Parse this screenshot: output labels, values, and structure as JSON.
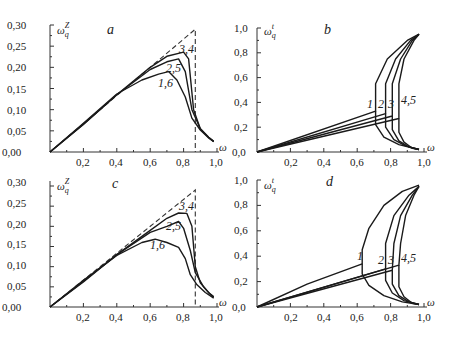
{
  "chart_data": [
    {
      "panel": "a",
      "type": "line",
      "title": "a",
      "xlabel": "ω",
      "ylabel": "ω_q^Z",
      "xlim": [
        0,
        1.0
      ],
      "ylim": [
        0,
        0.3
      ],
      "xticks": [
        "0,2",
        "0,4",
        "0,6",
        "0,8",
        "1,0"
      ],
      "yticks": [
        "0,00",
        "0,05",
        "0,10",
        "0,15",
        "0,20",
        "0,25",
        "0,30"
      ],
      "series": [
        {
          "name": "dashed",
          "style": "dashed",
          "points": [
            [
              0,
              0
            ],
            [
              0.87,
              0.29
            ],
            [
              0.87,
              0.0
            ]
          ]
        },
        {
          "name": "3,4",
          "points": [
            [
              0,
              0
            ],
            [
              0.2,
              0.065
            ],
            [
              0.4,
              0.135
            ],
            [
              0.6,
              0.2
            ],
            [
              0.7,
              0.226
            ],
            [
              0.8,
              0.236
            ],
            [
              0.83,
              0.22
            ],
            [
              0.86,
              0.1
            ],
            [
              0.9,
              0.055
            ],
            [
              0.95,
              0.035
            ],
            [
              0.98,
              0.025
            ]
          ]
        },
        {
          "name": "2,5",
          "points": [
            [
              0,
              0
            ],
            [
              0.2,
              0.066
            ],
            [
              0.4,
              0.135
            ],
            [
              0.6,
              0.195
            ],
            [
              0.7,
              0.213
            ],
            [
              0.77,
              0.22
            ],
            [
              0.81,
              0.19
            ],
            [
              0.85,
              0.1
            ],
            [
              0.9,
              0.055
            ],
            [
              0.95,
              0.034
            ],
            [
              0.98,
              0.025
            ]
          ]
        },
        {
          "name": "1,6",
          "points": [
            [
              0,
              0
            ],
            [
              0.2,
              0.068
            ],
            [
              0.4,
              0.137
            ],
            [
              0.55,
              0.17
            ],
            [
              0.65,
              0.184
            ],
            [
              0.71,
              0.19
            ],
            [
              0.76,
              0.17
            ],
            [
              0.81,
              0.13
            ],
            [
              0.85,
              0.08
            ],
            [
              0.9,
              0.052
            ],
            [
              0.95,
              0.033
            ],
            [
              0.98,
              0.024
            ]
          ]
        }
      ],
      "annotations": [
        "3,4",
        "2,5",
        "1,6"
      ]
    },
    {
      "panel": "b",
      "type": "line",
      "title": "b",
      "xlabel": "ω",
      "ylabel": "ω_q^t",
      "xlim": [
        0,
        1.0
      ],
      "ylim": [
        0,
        1.0
      ],
      "xticks": [
        "0,0",
        "0,2",
        "0,4",
        "0,6",
        "0,8",
        "1,0"
      ],
      "yticks": [
        "0,2",
        "0,4",
        "0,6",
        "0,8",
        "1,0"
      ],
      "series": [
        {
          "name": "1",
          "points": [
            [
              0,
              0
            ],
            [
              0.71,
              0.33
            ],
            [
              0.71,
              0.55
            ],
            [
              0.78,
              0.75
            ],
            [
              0.9,
              0.9
            ],
            [
              0.97,
              0.95
            ]
          ],
          "lower": [
            [
              0.71,
              0.33
            ],
            [
              0.71,
              0.22
            ],
            [
              0.76,
              0.12
            ],
            [
              0.85,
              0.06
            ],
            [
              0.97,
              0.02
            ]
          ]
        },
        {
          "name": "2",
          "points": [
            [
              0,
              0
            ],
            [
              0.77,
              0.31
            ],
            [
              0.77,
              0.55
            ],
            [
              0.83,
              0.75
            ],
            [
              0.92,
              0.9
            ],
            [
              0.97,
              0.95
            ]
          ],
          "lower": [
            [
              0.77,
              0.31
            ],
            [
              0.77,
              0.2
            ],
            [
              0.82,
              0.1
            ],
            [
              0.89,
              0.05
            ],
            [
              0.97,
              0.02
            ]
          ]
        },
        {
          "name": "3",
          "points": [
            [
              0,
              0
            ],
            [
              0.81,
              0.29
            ],
            [
              0.81,
              0.55
            ],
            [
              0.86,
              0.75
            ],
            [
              0.93,
              0.9
            ],
            [
              0.97,
              0.95
            ]
          ],
          "lower": [
            [
              0.81,
              0.29
            ],
            [
              0.81,
              0.18
            ],
            [
              0.85,
              0.09
            ],
            [
              0.91,
              0.04
            ],
            [
              0.97,
              0.02
            ]
          ]
        },
        {
          "name": "4,5",
          "points": [
            [
              0,
              0
            ],
            [
              0.85,
              0.27
            ],
            [
              0.85,
              0.55
            ],
            [
              0.88,
              0.75
            ],
            [
              0.94,
              0.9
            ],
            [
              0.97,
              0.95
            ]
          ],
          "lower": [
            [
              0.85,
              0.27
            ],
            [
              0.85,
              0.16
            ],
            [
              0.88,
              0.08
            ],
            [
              0.93,
              0.03
            ],
            [
              0.97,
              0.02
            ]
          ]
        }
      ],
      "annotations": [
        "1",
        "2",
        "3",
        "4,5"
      ]
    },
    {
      "panel": "c",
      "type": "line",
      "title": "c",
      "xlabel": "ω",
      "ylabel": "ω_q^Z",
      "xlim": [
        0,
        1.0
      ],
      "ylim": [
        0,
        0.3
      ],
      "xticks": [
        "0,2",
        "0,4",
        "0,6",
        "0,8",
        "1,0"
      ],
      "yticks": [
        "0,00",
        "0,05",
        "0,10",
        "0,15",
        "0,20",
        "0,25",
        "0,30"
      ],
      "series": [
        {
          "name": "dashed",
          "style": "dashed",
          "points": [
            [
              0,
              0
            ],
            [
              0.87,
              0.29
            ],
            [
              0.87,
              0.0
            ]
          ]
        },
        {
          "name": "3,4",
          "points": [
            [
              0,
              0
            ],
            [
              0.2,
              0.062
            ],
            [
              0.4,
              0.13
            ],
            [
              0.6,
              0.19
            ],
            [
              0.7,
              0.22
            ],
            [
              0.77,
              0.233
            ],
            [
              0.82,
              0.232
            ],
            [
              0.85,
              0.2
            ],
            [
              0.87,
              0.1
            ],
            [
              0.9,
              0.06
            ],
            [
              0.95,
              0.035
            ],
            [
              0.98,
              0.025
            ]
          ]
        },
        {
          "name": "2,5",
          "points": [
            [
              0,
              0
            ],
            [
              0.2,
              0.064
            ],
            [
              0.4,
              0.13
            ],
            [
              0.6,
              0.185
            ],
            [
              0.7,
              0.2
            ],
            [
              0.77,
              0.212
            ],
            [
              0.8,
              0.195
            ],
            [
              0.84,
              0.14
            ],
            [
              0.87,
              0.085
            ],
            [
              0.92,
              0.05
            ],
            [
              0.96,
              0.032
            ],
            [
              0.98,
              0.025
            ]
          ]
        },
        {
          "name": "1,6",
          "points": [
            [
              0,
              0
            ],
            [
              0.2,
              0.066
            ],
            [
              0.4,
              0.128
            ],
            [
              0.55,
              0.16
            ],
            [
              0.63,
              0.168
            ],
            [
              0.7,
              0.16
            ],
            [
              0.77,
              0.148
            ],
            [
              0.81,
              0.12
            ],
            [
              0.84,
              0.08
            ],
            [
              0.88,
              0.055
            ],
            [
              0.93,
              0.036
            ],
            [
              0.98,
              0.022
            ]
          ]
        }
      ],
      "annotations": [
        "3,4",
        "2,5",
        "1,6"
      ]
    },
    {
      "panel": "d",
      "type": "line",
      "title": "d",
      "xlabel": "ω",
      "ylabel": "ω_q^t",
      "xlim": [
        0,
        1.0
      ],
      "ylim": [
        0,
        1.0
      ],
      "xticks": [
        "0,0",
        "0,2",
        "0,4",
        "0,6",
        "0,8",
        "1,0"
      ],
      "yticks": [
        "0,2",
        "0,4",
        "0,6",
        "0,8",
        "1,0"
      ],
      "series": [
        {
          "name": "1",
          "points": [
            [
              0,
              0
            ],
            [
              0.3,
              0.18
            ],
            [
              0.63,
              0.34
            ],
            [
              0.63,
              0.45
            ],
            [
              0.67,
              0.62
            ],
            [
              0.76,
              0.8
            ],
            [
              0.87,
              0.91
            ],
            [
              0.97,
              0.96
            ]
          ],
          "lower": [
            [
              0.63,
              0.34
            ],
            [
              0.63,
              0.26
            ],
            [
              0.67,
              0.17
            ],
            [
              0.76,
              0.09
            ],
            [
              0.87,
              0.04
            ],
            [
              0.97,
              0.02
            ]
          ]
        },
        {
          "name": "2",
          "points": [
            [
              0,
              0
            ],
            [
              0.77,
              0.3
            ],
            [
              0.77,
              0.5
            ],
            [
              0.82,
              0.72
            ],
            [
              0.91,
              0.88
            ],
            [
              0.97,
              0.95
            ]
          ],
          "lower": [
            [
              0.77,
              0.3
            ],
            [
              0.77,
              0.21
            ],
            [
              0.81,
              0.11
            ],
            [
              0.88,
              0.05
            ],
            [
              0.97,
              0.02
            ]
          ]
        },
        {
          "name": "3",
          "points": [
            [
              0,
              0
            ],
            [
              0.81,
              0.29
            ],
            [
              0.82,
              0.5
            ],
            [
              0.86,
              0.72
            ],
            [
              0.93,
              0.88
            ],
            [
              0.97,
              0.95
            ]
          ],
          "lower": [
            [
              0.81,
              0.29
            ],
            [
              0.81,
              0.18
            ],
            [
              0.85,
              0.09
            ],
            [
              0.91,
              0.04
            ],
            [
              0.97,
              0.02
            ]
          ]
        },
        {
          "name": "4,5",
          "points": [
            [
              0,
              0
            ],
            [
              0.85,
              0.33
            ],
            [
              0.86,
              0.5
            ],
            [
              0.89,
              0.72
            ],
            [
              0.94,
              0.88
            ],
            [
              0.97,
              0.95
            ]
          ],
          "lower": [
            [
              0.85,
              0.33
            ],
            [
              0.85,
              0.16
            ],
            [
              0.88,
              0.08
            ],
            [
              0.93,
              0.03
            ],
            [
              0.97,
              0.02
            ]
          ]
        }
      ],
      "annotations": [
        "1",
        "2",
        "3",
        "4,5"
      ]
    }
  ],
  "panels": {
    "a": {
      "letter": "a",
      "ylabel_base": "ω",
      "ylabel_sub": "q",
      "ylabel_sup": "Z",
      "xlabel": "ω",
      "origin_label": "0,00",
      "yticks": [
        "0,05",
        "0,10",
        "0,15",
        "0,20",
        "0,25",
        "0,30"
      ],
      "xticks": [
        "0,2",
        "0,4",
        "0,6",
        "0,8",
        "1,0"
      ],
      "labels": [
        "3,4",
        "2,5",
        "1,6"
      ]
    },
    "b": {
      "letter": "b",
      "ylabel_base": "ω",
      "ylabel_sub": "q",
      "ylabel_sup": "t",
      "xlabel": "ω",
      "origin_label": "0,0",
      "yticks": [
        "0,2",
        "0,4",
        "0,6",
        "0,8",
        "1,0"
      ],
      "xticks": [
        "0,2",
        "0,4",
        "0,6",
        "0,8",
        "1,0"
      ],
      "labels": [
        "1",
        "2",
        "3",
        "4,5"
      ]
    },
    "c": {
      "letter": "c",
      "ylabel_base": "ω",
      "ylabel_sub": "q",
      "ylabel_sup": "Z",
      "xlabel": "ω",
      "origin_label": "0,00",
      "yticks": [
        "0,05",
        "0,10",
        "0,15",
        "0,20",
        "0,25",
        "0,30"
      ],
      "xticks": [
        "0,2",
        "0,4",
        "0,6",
        "0,8",
        "1,0"
      ],
      "labels": [
        "3,4",
        "2,5",
        "1,6"
      ]
    },
    "d": {
      "letter": "d",
      "ylabel_base": "ω",
      "ylabel_sub": "q",
      "ylabel_sup": "t",
      "xlabel": "ω",
      "origin_label": "0,0",
      "yticks": [
        "0,2",
        "0,4",
        "0,6",
        "0,8",
        "1,0"
      ],
      "xticks": [
        "0,2",
        "0,4",
        "0,6",
        "0,8",
        "1,0"
      ],
      "labels": [
        "1",
        "2",
        "3",
        "4,5"
      ]
    }
  }
}
